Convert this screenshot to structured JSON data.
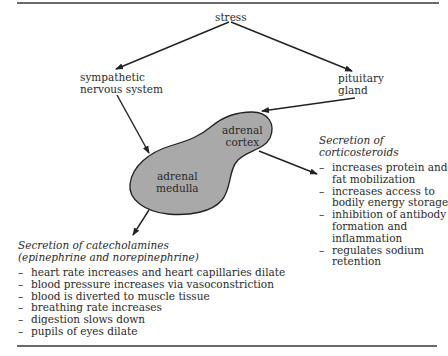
{
  "diagram": {
    "nodes": {
      "stress": "stress",
      "sympathetic_line1": "sympathetic",
      "sympathetic_line2": "nervous system",
      "pituitary_line1": "pituitary",
      "pituitary_line2": "gland",
      "cortex_line1": "adrenal",
      "cortex_line2": "cortex",
      "medulla_line1": "adrenal",
      "medulla_line2": "medulla"
    },
    "cortex_output": {
      "title_line1": "Secretion of",
      "title_line2": "corticosteroids",
      "items": [
        "increases protein and",
        "fat mobilization",
        "increases access to",
        "bodily energy storage",
        "inhibition of antibody",
        "formation and",
        "inflammation",
        "regulates sodium",
        "retention"
      ]
    },
    "medulla_output": {
      "title_line1": "Secretion of catecholamines",
      "title_line2": "(epinephrine and norepinephrine)",
      "items": [
        "heart rate increases and heart capillaries dilate",
        "blood pressure increases via vasoconstriction",
        "blood is diverted to muscle tissue",
        "breathing rate increases",
        "digestion slows down",
        "pupils of eyes dilate"
      ]
    },
    "colors": {
      "gland_fill": "#a9a9a9",
      "outline": "#222222",
      "rule": "#6a6a6a"
    }
  }
}
